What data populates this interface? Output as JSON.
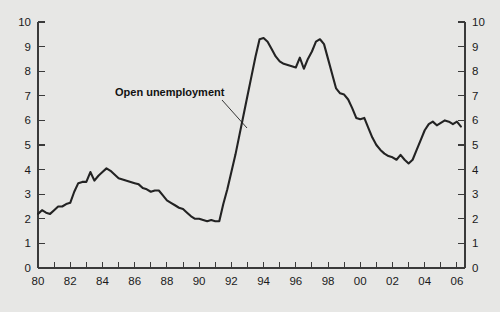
{
  "chart_data": {
    "type": "line",
    "title": "",
    "subtitle": "",
    "xlabel": "",
    "ylabel": "",
    "xlim": [
      1980,
      2006.5
    ],
    "ylim": [
      0,
      10
    ],
    "grid": false,
    "legend_position": "none",
    "background_color": "#e7e7e5",
    "line_color": "#232323",
    "axis_color": "#3a3a3a",
    "y_ticks": [
      0,
      1,
      2,
      3,
      4,
      5,
      6,
      7,
      8,
      9,
      10
    ],
    "y_tick_labels_left": [
      "0",
      "1",
      "2",
      "3",
      "4",
      "5",
      "6",
      "7",
      "8",
      "9",
      "10"
    ],
    "y_tick_labels_right": [
      "0",
      "1",
      "2",
      "3",
      "4",
      "5",
      "6",
      "7",
      "8",
      "9",
      "10"
    ],
    "x_ticks_all": [
      1980,
      1981,
      1982,
      1983,
      1984,
      1985,
      1986,
      1987,
      1988,
      1989,
      1990,
      1991,
      1992,
      1993,
      1994,
      1995,
      1996,
      1997,
      1998,
      1999,
      2000,
      2001,
      2002,
      2003,
      2004,
      2005,
      2006
    ],
    "x_tick_labels": [
      "80",
      "82",
      "84",
      "86",
      "88",
      "90",
      "92",
      "94",
      "96",
      "98",
      "00",
      "02",
      "04",
      "06"
    ],
    "x_tick_label_values": [
      1980,
      1982,
      1984,
      1986,
      1988,
      1990,
      1992,
      1994,
      1996,
      1998,
      2000,
      2002,
      2004,
      2006
    ],
    "annotations": [
      {
        "text": "Open unemployment",
        "x_px": 115,
        "y_px": 96,
        "leader_from_px": [
          222,
          100
        ],
        "leader_to_px": [
          247,
          128
        ]
      }
    ],
    "series": [
      {
        "name": "Open unemployment",
        "x": [
          1980.0,
          1980.25,
          1980.5,
          1980.75,
          1981.0,
          1981.25,
          1981.5,
          1981.75,
          1982.0,
          1982.25,
          1982.5,
          1982.75,
          1983.0,
          1983.25,
          1983.5,
          1983.75,
          1984.0,
          1984.25,
          1984.5,
          1984.75,
          1985.0,
          1985.25,
          1985.5,
          1985.75,
          1986.0,
          1986.25,
          1986.5,
          1986.75,
          1987.0,
          1987.25,
          1987.5,
          1987.75,
          1988.0,
          1988.25,
          1988.5,
          1988.75,
          1989.0,
          1989.25,
          1989.5,
          1989.75,
          1990.0,
          1990.25,
          1990.5,
          1990.75,
          1991.0,
          1991.25,
          1991.5,
          1991.75,
          1992.0,
          1992.25,
          1992.5,
          1992.75,
          1993.0,
          1993.25,
          1993.5,
          1993.75,
          1994.0,
          1994.25,
          1994.5,
          1994.75,
          1995.0,
          1995.25,
          1995.5,
          1995.75,
          1996.0,
          1996.25,
          1996.5,
          1996.75,
          1997.0,
          1997.25,
          1997.5,
          1997.75,
          1998.0,
          1998.25,
          1998.5,
          1998.75,
          1999.0,
          1999.25,
          1999.5,
          1999.75,
          2000.0,
          2000.25,
          2000.5,
          2000.75,
          2001.0,
          2001.25,
          2001.5,
          2001.75,
          2002.0,
          2002.25,
          2002.5,
          2002.75,
          2003.0,
          2003.25,
          2003.5,
          2003.75,
          2004.0,
          2004.25,
          2004.5,
          2004.75,
          2005.0,
          2005.25,
          2005.5,
          2005.75,
          2006.0,
          2006.25
        ],
        "y": [
          2.2,
          2.35,
          2.25,
          2.2,
          2.35,
          2.5,
          2.5,
          2.6,
          2.65,
          3.1,
          3.45,
          3.5,
          3.5,
          3.9,
          3.55,
          3.75,
          3.9,
          4.05,
          3.95,
          3.8,
          3.65,
          3.6,
          3.55,
          3.5,
          3.45,
          3.4,
          3.25,
          3.2,
          3.1,
          3.15,
          3.15,
          2.95,
          2.75,
          2.65,
          2.55,
          2.45,
          2.4,
          2.25,
          2.1,
          2.0,
          2.0,
          1.95,
          1.9,
          1.95,
          1.9,
          1.9,
          2.6,
          3.2,
          3.9,
          4.6,
          5.4,
          6.2,
          7.0,
          7.8,
          8.6,
          9.3,
          9.35,
          9.2,
          8.9,
          8.6,
          8.4,
          8.3,
          8.25,
          8.2,
          8.15,
          8.55,
          8.1,
          8.5,
          8.8,
          9.2,
          9.3,
          9.1,
          8.5,
          7.9,
          7.3,
          7.1,
          7.05,
          6.85,
          6.5,
          6.1,
          6.05,
          6.1,
          5.7,
          5.3,
          5.0,
          4.8,
          4.65,
          4.55,
          4.5,
          4.4,
          4.6,
          4.4,
          4.25,
          4.4,
          4.8,
          5.2,
          5.6,
          5.85,
          5.95,
          5.8,
          5.9,
          6.0,
          5.95,
          5.85,
          5.95,
          5.75
        ]
      }
    ]
  },
  "figure": {
    "plot_box_px": {
      "left": 38,
      "top": 22,
      "right": 465,
      "bottom": 268
    }
  }
}
